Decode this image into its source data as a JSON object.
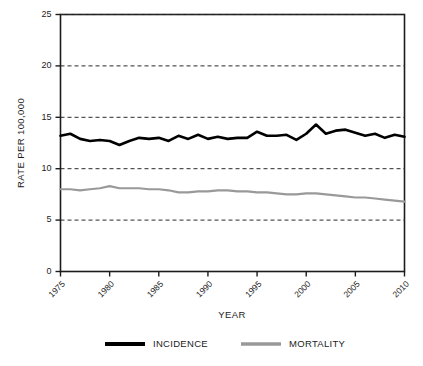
{
  "chart_data": {
    "type": "line",
    "title": "",
    "xlabel": "YEAR",
    "ylabel": "RATE PER 100,000",
    "xlim": [
      1975,
      2010
    ],
    "ylim": [
      0,
      25
    ],
    "yticks": [
      0,
      5,
      10,
      15,
      20,
      25
    ],
    "ytick_labels": [
      "0",
      "5",
      "10",
      "15",
      "20",
      "25"
    ],
    "xticks": [
      1975,
      1980,
      1985,
      1990,
      1995,
      2000,
      2005,
      2010
    ],
    "xtick_labels": [
      "1975",
      "1980",
      "1985",
      "1990",
      "1995",
      "2000",
      "2005",
      "2010"
    ],
    "grid": "horizontal-dashed",
    "legend_position": "bottom",
    "x": [
      1975,
      1976,
      1977,
      1978,
      1979,
      1980,
      1981,
      1982,
      1983,
      1984,
      1985,
      1986,
      1987,
      1988,
      1989,
      1990,
      1991,
      1992,
      1993,
      1994,
      1995,
      1996,
      1997,
      1998,
      1999,
      2000,
      2001,
      2002,
      2003,
      2004,
      2005,
      2006,
      2007,
      2008,
      2009,
      2010
    ],
    "series": [
      {
        "name": "INCIDENCE",
        "color": "#000000",
        "values": [
          13.2,
          13.4,
          12.9,
          12.7,
          12.8,
          12.7,
          12.3,
          12.7,
          13.0,
          12.9,
          13.0,
          12.7,
          13.2,
          12.9,
          13.3,
          12.9,
          13.1,
          12.9,
          13.0,
          13.0,
          13.6,
          13.2,
          13.2,
          13.3,
          12.8,
          13.4,
          14.3,
          13.4,
          13.7,
          13.8,
          13.5,
          13.2,
          13.4,
          13.0,
          13.3,
          13.1
        ]
      },
      {
        "name": "MORTALITY",
        "color": "#999999",
        "values": [
          8.0,
          8.0,
          7.9,
          8.0,
          8.1,
          8.3,
          8.1,
          8.1,
          8.1,
          8.0,
          8.0,
          7.9,
          7.7,
          7.7,
          7.8,
          7.8,
          7.9,
          7.9,
          7.8,
          7.8,
          7.7,
          7.7,
          7.6,
          7.5,
          7.5,
          7.6,
          7.6,
          7.5,
          7.4,
          7.3,
          7.2,
          7.2,
          7.1,
          7.0,
          6.9,
          6.8
        ]
      }
    ]
  },
  "legend": {
    "items": [
      {
        "label": "INCIDENCE",
        "color": "#000000"
      },
      {
        "label": "MORTALITY",
        "color": "#999999"
      }
    ]
  },
  "axes": {
    "y_title": "RATE PER 100,000",
    "x_title": "YEAR"
  }
}
